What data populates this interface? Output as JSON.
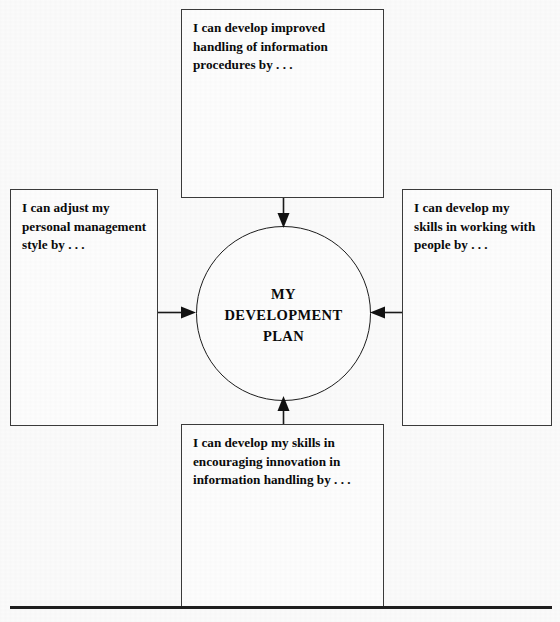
{
  "diagram": {
    "title": "My Development Plan",
    "center": {
      "label": "MY\nDEVELOPMENT\nPLAN",
      "shape": "circle"
    },
    "boxes": [
      {
        "id": "top",
        "position": "top",
        "text": "I can develop improved handling of information procedures by . . ."
      },
      {
        "id": "left",
        "position": "left",
        "text": "I can adjust my personal management style by . . ."
      },
      {
        "id": "right",
        "position": "right",
        "text": "I can develop my skills in working with people by . . ."
      },
      {
        "id": "bottom",
        "position": "bottom",
        "text": "I can develop my skills in encouraging innovation in information handling by . . ."
      }
    ],
    "connectors": [
      {
        "from": "top",
        "to": "center",
        "direction": "down",
        "arrowhead": "filled-triangle"
      },
      {
        "from": "left",
        "to": "center",
        "direction": "right",
        "arrowhead": "filled-triangle"
      },
      {
        "from": "right",
        "to": "center",
        "direction": "left",
        "arrowhead": "filled-triangle"
      },
      {
        "from": "bottom",
        "to": "center",
        "direction": "up",
        "arrowhead": "filled-triangle"
      }
    ],
    "colors": {
      "background": "#fbfbfb",
      "box_fill": "#fdfdfd",
      "box_border": "#3b3b3b",
      "circle_border": "#1c1c1c",
      "text": "#0a0a0a",
      "rule": "#1e1e1e"
    }
  }
}
